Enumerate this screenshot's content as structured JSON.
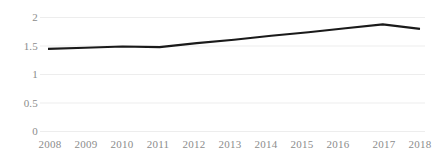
{
  "chart_data": {
    "type": "line",
    "title": "",
    "subtitle": "",
    "xlabel": "",
    "ylabel": "",
    "categories": [
      "2008",
      "2009",
      "2010",
      "2011",
      "2012",
      "2013",
      "2014",
      "2015",
      "2016",
      "2017",
      "2018"
    ],
    "series": [
      {
        "name": "",
        "values": [
          1.45,
          1.47,
          1.49,
          1.48,
          1.55,
          1.61,
          1.68,
          1.74,
          1.81,
          1.88,
          1.8
        ],
        "color": "#1a1a1a"
      }
    ],
    "ylim": [
      0,
      2
    ],
    "yticks": [
      0,
      0.5,
      1,
      1.5,
      2
    ],
    "ytick_labels": [
      "0",
      "0.5",
      "1",
      "1.5",
      "2"
    ],
    "grid": true,
    "grid_axis": "y",
    "grid_color": "#ededed",
    "legend": false,
    "legend_position": "none",
    "annotations": []
  },
  "axes": {
    "y_labels": [
      "2",
      "1.5",
      "1",
      "0.5",
      "0"
    ],
    "x_labels": [
      "2008",
      "2009",
      "2010",
      "2011",
      "2012",
      "2013",
      "2014",
      "2015",
      "2016",
      "2017",
      "2018"
    ],
    "tick_color": "#8c8c8c"
  },
  "style": {
    "background": "#ffffff",
    "line_color": "#1a1a1a",
    "gridline_color": "#ededed"
  }
}
